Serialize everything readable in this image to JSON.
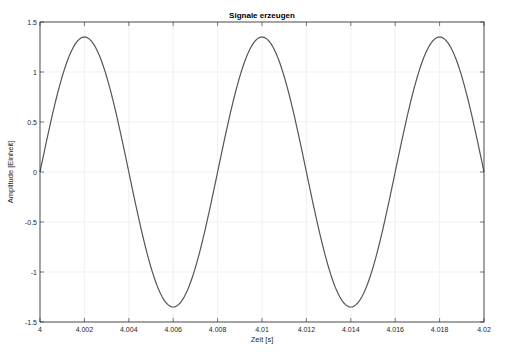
{
  "chart_data": {
    "type": "line",
    "title": "Signale erzeugen",
    "xlabel": "Zeit [s]",
    "ylabel": "Amplitude [Einheit]",
    "xlim": [
      4,
      4.02
    ],
    "ylim": [
      -1.5,
      1.5
    ],
    "xticks": [
      4,
      4.002,
      4.004,
      4.006,
      4.008,
      4.01,
      4.012,
      4.014,
      4.016,
      4.018,
      4.02
    ],
    "xtick_labels": [
      "4",
      "4.002",
      "4.004",
      "4.006",
      "4.008",
      "4.01",
      "4.012",
      "4.014",
      "4.016",
      "4.018",
      "4.02"
    ],
    "yticks": [
      -1.5,
      -1,
      -0.5,
      0,
      0.5,
      1,
      1.5
    ],
    "ytick_labels": [
      "-1.5",
      "-1",
      "-0.5",
      "0",
      "0.5",
      "1",
      "1.5"
    ],
    "grid": true,
    "legend": null,
    "series": [
      {
        "name": "signal",
        "color": "#555555",
        "function": "1.35*sin(2*pi*125*(t-4))",
        "amplitude": 1.35,
        "frequency_hz": 125,
        "x": [
          4,
          4.001,
          4.002,
          4.003,
          4.004,
          4.005,
          4.006,
          4.007,
          4.008,
          4.009,
          4.01,
          4.011,
          4.012,
          4.013,
          4.014,
          4.015,
          4.016,
          4.017,
          4.018,
          4.019,
          4.02
        ],
        "values": [
          0,
          0.95,
          1.35,
          0.95,
          0,
          -0.95,
          -1.35,
          -0.95,
          0,
          0.95,
          1.35,
          0.95,
          0,
          -0.95,
          -1.35,
          -0.95,
          0,
          0.95,
          1.35,
          0.95,
          0
        ]
      }
    ]
  },
  "colors": {
    "axis": "#262626",
    "grid": "#e6e6e6",
    "line": "#555555"
  }
}
